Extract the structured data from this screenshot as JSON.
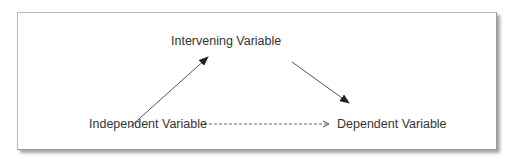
{
  "diagram": {
    "type": "mediation-model",
    "nodes": [
      {
        "id": "intervening",
        "label": "Intervening Variable"
      },
      {
        "id": "independent",
        "label": "Independent Variable"
      },
      {
        "id": "dependent",
        "label": "Dependent Variable"
      }
    ],
    "edges": [
      {
        "from": "independent",
        "to": "intervening",
        "style": "solid"
      },
      {
        "from": "intervening",
        "to": "dependent",
        "style": "solid"
      },
      {
        "from": "independent",
        "to": "dependent",
        "style": "dashed"
      }
    ],
    "colors": {
      "text": "#333333",
      "line": "#555555",
      "arrowhead": "#222222",
      "frame_border": "#b8b8b8",
      "shadow": "#5a5a5a"
    }
  }
}
